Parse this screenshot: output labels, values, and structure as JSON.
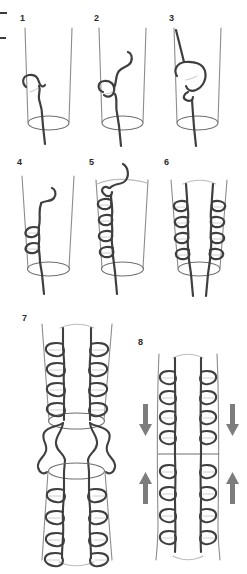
{
  "figure": {
    "background_color": "#ffffff",
    "panel_count": 8,
    "colors": {
      "suture_thread": "#3f3f3f",
      "vessel_outline": "#8c8c8c",
      "vessel_rim": "#6e6e6e",
      "arrow_fill": "#7d7d7d",
      "number_color": "#2a2a2a",
      "crop_mark": "#3c3c3c"
    },
    "crop_marks": [
      {
        "name": "top-left-tick",
        "x": 0,
        "y": 12,
        "width": 7,
        "height": 2
      },
      {
        "name": "lower-left-tick",
        "x": 0,
        "y": 37,
        "width": 6,
        "height": 2
      }
    ],
    "panels": [
      {
        "number": "1",
        "caption": "First suture loop placed at vessel edge",
        "row": 1,
        "column": 1,
        "stitch_count": 1,
        "sides_sutured": "left",
        "has_arrows": false
      },
      {
        "number": "2",
        "caption": "Needle carried through, thread loop drawn up",
        "row": 1,
        "column": 2,
        "stitch_count": 1,
        "sides_sutured": "left",
        "has_arrows": false
      },
      {
        "number": "3",
        "caption": "Loop enlarged and pulled over the vessel wall",
        "row": 1,
        "column": 3,
        "stitch_count": 1,
        "sides_sutured": "left",
        "has_arrows": false
      },
      {
        "number": "4",
        "caption": "Two running stitches completed along left wall",
        "row": 2,
        "column": 1,
        "stitch_count": 2,
        "sides_sutured": "left",
        "has_arrows": false
      },
      {
        "number": "5",
        "caption": "Running suture continued to four stitches",
        "row": 2,
        "column": 2,
        "stitch_count": 4,
        "sides_sutured": "left",
        "has_arrows": false
      },
      {
        "number": "6",
        "caption": "Both walls sutured, free ends exiting at base",
        "row": 2,
        "column": 3,
        "stitch_count": 8,
        "sides_sutured": "both",
        "has_arrows": false
      },
      {
        "number": "7",
        "caption": "Two vessel ends approximated, threads tied between rims",
        "row": 3,
        "column": 1,
        "stitch_count": 16,
        "sides_sutured": "both",
        "has_arrows": false
      },
      {
        "number": "8",
        "caption": "Suture lines drawn together, completing the anastomosis",
        "row": 3,
        "column": 2,
        "stitch_count": 16,
        "sides_sutured": "both",
        "has_arrows": true,
        "arrows": [
          {
            "name": "arrow-down-left",
            "direction": "down"
          },
          {
            "name": "arrow-down-right",
            "direction": "down"
          },
          {
            "name": "arrow-up-left",
            "direction": "up"
          },
          {
            "name": "arrow-up-right",
            "direction": "up"
          }
        ],
        "anastomosis_line": true
      }
    ]
  }
}
